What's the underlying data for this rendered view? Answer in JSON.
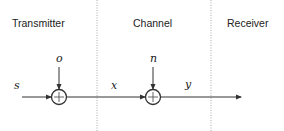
{
  "diagram": {
    "sections": [
      {
        "id": "transmitter",
        "label": "Transmitter"
      },
      {
        "id": "channel",
        "label": "Channel"
      },
      {
        "id": "receiver",
        "label": "Receiver"
      }
    ],
    "nodes": [
      {
        "id": "sum1",
        "type": "summing-junction",
        "symbol": "+",
        "input_label": "o"
      },
      {
        "id": "sum2",
        "type": "summing-junction",
        "symbol": "+",
        "input_label": "n"
      }
    ],
    "signals": {
      "input": "s",
      "intermediate": "x",
      "output": "y"
    },
    "colors": {
      "line": "#333333",
      "divider": "#aaaaaa",
      "text": "#222222"
    }
  }
}
